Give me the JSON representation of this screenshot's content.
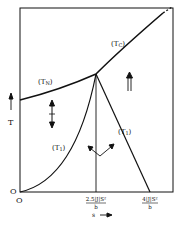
{
  "diagram": {
    "type": "phase-diagram",
    "axes": {
      "y_label": "T",
      "x_label": "s",
      "origin_label": "O",
      "origin_y_label": "O"
    },
    "x_ticks": [
      {
        "numerator": "2.5|J|S²",
        "denominator": "b"
      },
      {
        "numerator": "4|J|S²",
        "denominator": "b"
      }
    ],
    "curves": [
      {
        "name": "T_N",
        "label": "(T",
        "sub": "N",
        "close": ")"
      },
      {
        "name": "T_C",
        "label": "(T",
        "sub": "C",
        "close": ")"
      },
      {
        "name": "T_1",
        "label": "(T",
        "sub": "1",
        "close": ")"
      },
      {
        "name": "T_2",
        "label": "(T",
        "sub": "1",
        "close": ")"
      }
    ],
    "region_symbols": {
      "antiferro": "↕",
      "ferro": "⇑",
      "canted": "∨"
    },
    "colors": {
      "ink": "#111111",
      "background": "#ffffff"
    }
  }
}
